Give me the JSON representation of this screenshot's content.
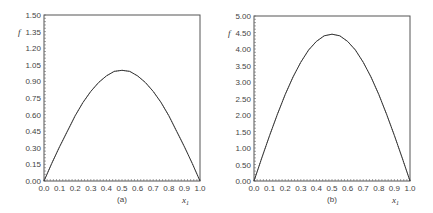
{
  "chart_data": [
    {
      "type": "line",
      "caption": "(a)",
      "xlabel": "x1",
      "ylabel": "f",
      "xlim": [
        0.0,
        1.0
      ],
      "ylim": [
        0.0,
        1.5
      ],
      "xticks": [
        "0.0",
        "0.1",
        "0.2",
        "0.3",
        "0.4",
        "0.5",
        "0.6",
        "0.7",
        "0.8",
        "0.9",
        "1.0"
      ],
      "yticks": [
        "0.00",
        "0.15",
        "0.30",
        "0.45",
        "0.60",
        "0.75",
        "0.90",
        "1.05",
        "1.20",
        "1.35",
        "1.50"
      ],
      "grid": false,
      "series": [
        {
          "name": "f",
          "x": [
            0.0,
            0.05,
            0.1,
            0.15,
            0.2,
            0.25,
            0.3,
            0.35,
            0.4,
            0.45,
            0.5,
            0.55,
            0.6,
            0.65,
            0.7,
            0.75,
            0.8,
            0.85,
            0.9,
            0.95,
            1.0
          ],
          "values": [
            0.0,
            0.16,
            0.31,
            0.45,
            0.59,
            0.71,
            0.81,
            0.89,
            0.95,
            0.99,
            1.0,
            0.99,
            0.95,
            0.89,
            0.81,
            0.71,
            0.59,
            0.45,
            0.31,
            0.16,
            0.0
          ]
        }
      ]
    },
    {
      "type": "line",
      "caption": "(b)",
      "xlabel": "x1",
      "ylabel": "f",
      "xlim": [
        0.0,
        1.0
      ],
      "ylim": [
        0.0,
        5.0
      ],
      "xticks": [
        "0.0",
        "0.1",
        "0.2",
        "0.3",
        "0.4",
        "0.5",
        "0.6",
        "0.7",
        "0.8",
        "0.9",
        "1.0"
      ],
      "yticks": [
        "0.00",
        "0.50",
        "1.00",
        "1.50",
        "2.00",
        "2.50",
        "3.00",
        "3.50",
        "4.00",
        "4.50",
        "5.00"
      ],
      "grid": false,
      "series": [
        {
          "name": "f",
          "x": [
            0.0,
            0.05,
            0.1,
            0.15,
            0.2,
            0.25,
            0.3,
            0.35,
            0.4,
            0.45,
            0.5,
            0.55,
            0.6,
            0.65,
            0.7,
            0.75,
            0.8,
            0.85,
            0.9,
            0.95,
            1.0
          ],
          "values": [
            0.0,
            0.7,
            1.38,
            2.02,
            2.62,
            3.15,
            3.6,
            3.97,
            4.23,
            4.4,
            4.45,
            4.4,
            4.23,
            3.97,
            3.6,
            3.15,
            2.62,
            2.02,
            1.38,
            0.7,
            0.0
          ]
        }
      ]
    }
  ]
}
